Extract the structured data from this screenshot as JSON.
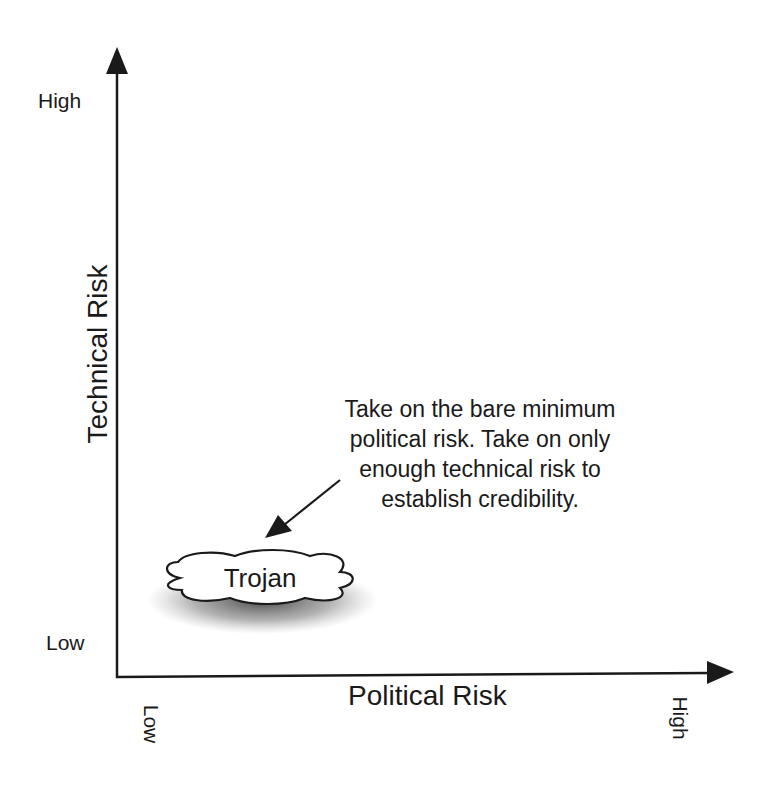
{
  "diagram": {
    "y_axis": {
      "title": "Technical Risk",
      "high_label": "High",
      "low_label": "Low"
    },
    "x_axis": {
      "title": "Political Risk",
      "low_label": "Low",
      "high_label": "High"
    },
    "region": {
      "label": "Trojan",
      "shape": "cloud"
    },
    "annotation": {
      "lines": [
        "Take on the bare minimum",
        "political risk. Take on only",
        "enough technical risk to",
        "establish credibility."
      ]
    }
  },
  "colors": {
    "ink": "#1a1a1a",
    "background": "#ffffff",
    "cloud_fill": "#ffffff"
  }
}
